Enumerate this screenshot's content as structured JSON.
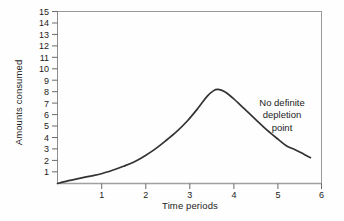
{
  "chart_data": {
    "type": "line",
    "title": "",
    "subtitle": "",
    "xlabel": "Time periods",
    "ylabel": "Amounts consumed",
    "xlim": [
      0,
      6
    ],
    "ylim": [
      0,
      15
    ],
    "xticks": [
      "1",
      "2",
      "3",
      "4",
      "5",
      "6"
    ],
    "xtick_values": [
      1,
      2,
      3,
      4,
      5,
      6
    ],
    "yticks": [
      "15",
      "14",
      "13",
      "12",
      "11",
      "10",
      "9",
      "8",
      "7",
      "6",
      "5",
      "4",
      "3",
      "2",
      "1"
    ],
    "ytick_values": [
      15,
      14,
      13,
      12,
      11,
      10,
      9,
      8,
      7,
      6,
      5,
      4,
      3,
      2,
      1
    ],
    "grid": false,
    "legend": false,
    "legend_position": "none",
    "series": [
      {
        "name": "Amounts consumed",
        "color": "#333333",
        "x": [
          0.0,
          0.25,
          0.5,
          0.75,
          1.0,
          1.25,
          1.5,
          1.75,
          2.0,
          2.2,
          2.45,
          2.7,
          2.95,
          3.2,
          3.4,
          3.55,
          3.65,
          3.8,
          4.0,
          4.25,
          4.5,
          4.75,
          5.0,
          5.2,
          5.4,
          5.6,
          5.75
        ],
        "y": [
          0.0,
          0.25,
          0.45,
          0.65,
          0.85,
          1.15,
          1.5,
          1.9,
          2.45,
          2.95,
          3.7,
          4.5,
          5.45,
          6.6,
          7.6,
          8.1,
          8.2,
          8.0,
          7.4,
          6.5,
          5.6,
          4.7,
          3.9,
          3.3,
          2.95,
          2.55,
          2.25
        ]
      }
    ],
    "annotations": [
      {
        "name": "no-definite-depletion-point",
        "lines": [
          "No definite",
          "depletion",
          "point"
        ],
        "x": 5.3,
        "y": 7.0
      }
    ],
    "axes_style": {
      "box": true,
      "box_color": "#888888",
      "tick_color": "#555555",
      "baseline_color": "#999999",
      "line_color": "#333333",
      "background": "#fefefe"
    }
  }
}
